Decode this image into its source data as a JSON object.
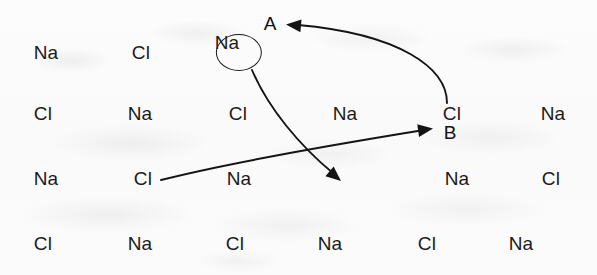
{
  "figure": {
    "background_color": "#fbfbfb",
    "ink_color": "#1b1b1b",
    "lattice": {
      "rows": [
        {
          "y": 52,
          "cells": [
            {
              "label": "Na",
              "x": 46
            },
            {
              "label": "Cl",
              "x": 141
            },
            {
              "label": "Na",
              "x": 239,
              "circled": true
            }
          ]
        },
        {
          "y": 113,
          "cells": [
            {
              "label": "Cl",
              "x": 43
            },
            {
              "label": "Na",
              "x": 140
            },
            {
              "label": "Cl",
              "x": 238
            },
            {
              "label": "Na",
              "x": 345
            },
            {
              "label": "Cl",
              "x": 452
            },
            {
              "label": "Na",
              "x": 553
            }
          ]
        },
        {
          "y": 178,
          "cells": [
            {
              "label": "Na",
              "x": 46
            },
            {
              "label": "Cl",
              "x": 143
            },
            {
              "label": "Na",
              "x": 239
            },
            {
              "label": "Na",
              "x": 457
            },
            {
              "label": "Cl",
              "x": 551
            }
          ]
        },
        {
          "y": 243,
          "cells": [
            {
              "label": "Cl",
              "x": 43
            },
            {
              "label": "Na",
              "x": 140
            },
            {
              "label": "Cl",
              "x": 235
            },
            {
              "label": "Na",
              "x": 330
            },
            {
              "label": "Cl",
              "x": 427
            },
            {
              "label": "Na",
              "x": 521
            }
          ]
        }
      ]
    },
    "markers": [
      {
        "name": "marker-a",
        "text": "A",
        "x": 270,
        "y": 23
      },
      {
        "name": "marker-b",
        "text": "B",
        "x": 450,
        "y": 132
      }
    ],
    "arrows": [
      {
        "name": "arrow-to-a",
        "description": "curve from the Cl at site B sweeping up and to the left, arrowhead at label A",
        "path": "M 447,103 C 447,68 400,34 298,25",
        "head_x": 286,
        "head_y": 24.5,
        "head_angle_deg": 185
      },
      {
        "name": "arrow-circled-na-to-vacancy",
        "description": "curve from the circled Na descending to the right, arrowhead between the Na of row 3 and the Na of row 2",
        "path": "M 252,70 C 268,108 300,146 334,174",
        "head_x": 341,
        "head_y": 181,
        "head_angle_deg": 40
      },
      {
        "name": "arrow-lower-cl-to-b",
        "description": "long shallow curve from the Cl in row 3 rising to the right, arrowhead just left of the Cl at site B",
        "path": "M 161,180 C 240,160 350,142 424,130",
        "head_x": 433,
        "head_y": 128.5,
        "head_angle_deg": 352
      }
    ]
  }
}
